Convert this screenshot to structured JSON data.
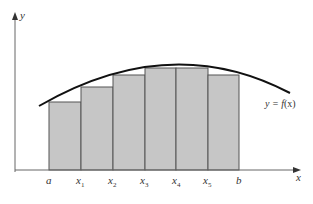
{
  "diagram": {
    "axes": {
      "x_label": "x",
      "y_label": "y"
    },
    "curve_label": "y = f(x)",
    "curve_label_parts": {
      "prefix": "y = ",
      "func": "f",
      "arg": "(x)"
    },
    "tick_labels": [
      {
        "base": "a",
        "sub": ""
      },
      {
        "base": "x",
        "sub": "1"
      },
      {
        "base": "x",
        "sub": "2"
      },
      {
        "base": "x",
        "sub": "3"
      },
      {
        "base": "x",
        "sub": "4"
      },
      {
        "base": "x",
        "sub": "5"
      },
      {
        "base": "b",
        "sub": ""
      }
    ],
    "rectangles": [
      {
        "from": "a",
        "to": "x1",
        "height_px": 68
      },
      {
        "from": "x1",
        "to": "x2",
        "height_px": 83
      },
      {
        "from": "x2",
        "to": "x3",
        "height_px": 95
      },
      {
        "from": "x3",
        "to": "x4",
        "height_px": 102
      },
      {
        "from": "x4",
        "to": "x5",
        "height_px": 102
      },
      {
        "from": "x5",
        "to": "b",
        "height_px": 95
      }
    ],
    "colors": {
      "rect_fill": "#c6c6c6",
      "rect_stroke": "#555555",
      "curve": "#111111",
      "axis": "#555555"
    }
  }
}
